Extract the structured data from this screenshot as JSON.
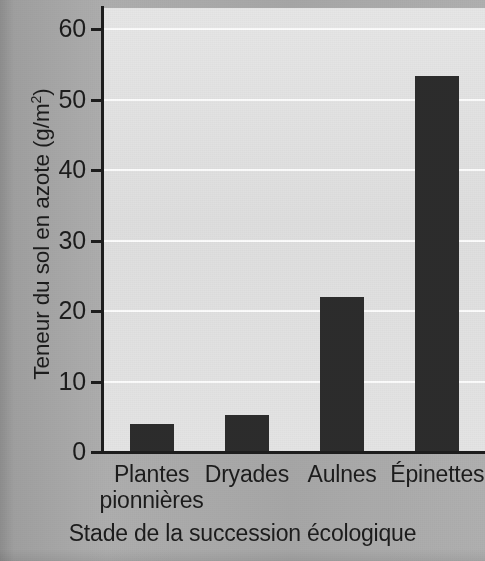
{
  "chart_data": {
    "type": "bar",
    "title": "",
    "subtitle": "",
    "xlabel": "Stade de la succession écologique",
    "ylabel": "Teneur du sol en azote (g/m²)",
    "ylabel_main": "Teneur du sol en azote (g/m",
    "ylabel_sup": "2",
    "ylabel_close": ")",
    "categories": [
      "Plantes pionnières",
      "Dryades",
      "Aulnes",
      "Épinettes"
    ],
    "category_lines": [
      [
        "Plantes",
        "pionnières"
      ],
      [
        "Dryades"
      ],
      [
        "Aulnes"
      ],
      [
        "Épinettes"
      ]
    ],
    "values": [
      4,
      5.3,
      22,
      53.3
    ],
    "ylim": [
      0,
      63
    ],
    "xlim": [
      0,
      4
    ],
    "yticks": [
      0,
      10,
      20,
      30,
      40,
      50,
      60
    ],
    "ytick_labels": [
      "0",
      "10",
      "20",
      "30",
      "40",
      "50",
      "60"
    ],
    "grid": true,
    "grid_axis": "y",
    "legend": null,
    "bar_color": "#2c2c2c",
    "plot_background": "#e3e3e3",
    "figure_background": "#a9a9a9",
    "gridline_color": "#fdfdfd",
    "axis_color": "#1d1d1d"
  }
}
